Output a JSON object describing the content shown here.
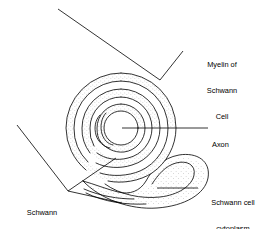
{
  "figure": {
    "width": 269,
    "height": 229,
    "background_color": "#ffffff",
    "line_color": "#000000",
    "stipple_color": "#9a9a9a"
  },
  "labels": {
    "myelin": {
      "line1": "Myelin of",
      "line2": "Schwann",
      "line3": "Cell",
      "text": "Myelin of Schwann Cell",
      "align": "center"
    },
    "axon": {
      "line1": "Axon",
      "text": "Axon",
      "align": "left"
    },
    "cytoplasm": {
      "line1": "Schwann cell",
      "line2": "cytoplasm",
      "text": "Schwann cell cytoplasm",
      "align": "center"
    },
    "schwann_cell": {
      "line1": "Schwann",
      "line2": "Cell",
      "text": "Schwann Cell",
      "align": "center"
    }
  },
  "parts": {
    "axon_label": "axon-core",
    "myelin_label": "myelin-spiral",
    "cytoplasm_label": "schwann-cytoplasm-lobe",
    "cell_label": "schwann-cell-body"
  }
}
